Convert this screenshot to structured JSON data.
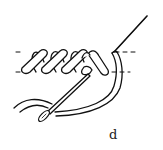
{
  "figure": {
    "label": "d",
    "type": "embroidery stitch diagram",
    "colors": {
      "stroke": "#111111",
      "background": "#ffffff"
    }
  }
}
